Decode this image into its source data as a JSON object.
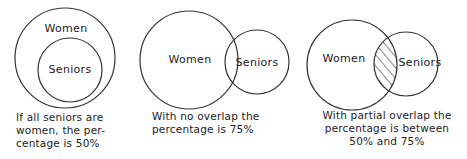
{
  "panels": [
    {
      "id": "all-seniors-women",
      "circles": {
        "women": "Women",
        "seniors": "Seniors"
      },
      "caption_lines": [
        "If all seniors are",
        "women, the per-",
        "centage is 50%"
      ]
    },
    {
      "id": "no-overlap",
      "circles": {
        "women": "Women",
        "seniors": "Seniors"
      },
      "caption_lines": [
        "With no overlap the",
        "percentage is 75%"
      ]
    },
    {
      "id": "partial-overlap",
      "circles": {
        "women": "Women",
        "seniors": "Seniors"
      },
      "caption_lines": [
        "With partial overlap the",
        "percentage is between",
        "50% and 75%"
      ]
    }
  ],
  "colors": {
    "stroke": "#333333",
    "background": "#ffffff"
  }
}
